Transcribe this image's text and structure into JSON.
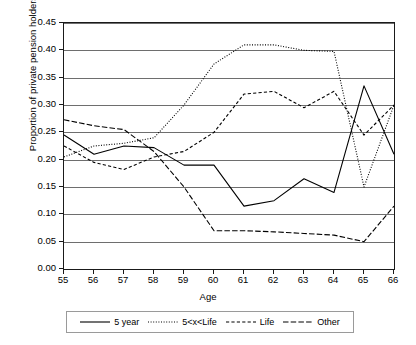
{
  "chart_data": {
    "type": "line",
    "title": "",
    "xlabel": "Age",
    "ylabel": "Proportion of private pension holders",
    "x": [
      55,
      56,
      57,
      58,
      59,
      60,
      61,
      62,
      63,
      64,
      65,
      66
    ],
    "xlim": [
      55,
      66
    ],
    "ylim": [
      0.0,
      0.45
    ],
    "ytick_labels": [
      "0.00",
      "0.05",
      "0.10",
      "0.15",
      "0.20",
      "0.25",
      "0.30",
      "0.35",
      "0.40",
      "0.45"
    ],
    "ytick_values": [
      0.0,
      0.05,
      0.1,
      0.15,
      0.2,
      0.25,
      0.3,
      0.35,
      0.4,
      0.45
    ],
    "xtick_labels": [
      "55",
      "56",
      "57",
      "58",
      "59",
      "60",
      "61",
      "62",
      "63",
      "64",
      "65",
      "66"
    ],
    "grid": true,
    "legend_position": "bottom",
    "series": [
      {
        "name": "5 year",
        "style": "solid",
        "color": "#000000",
        "values": [
          0.245,
          0.21,
          0.225,
          0.222,
          0.19,
          0.19,
          0.115,
          0.125,
          0.165,
          0.14,
          0.335,
          0.21
        ]
      },
      {
        "name": "5<x<Life",
        "style": "dotted",
        "color": "#000000",
        "values": [
          0.205,
          0.225,
          0.23,
          0.24,
          0.3,
          0.375,
          0.41,
          0.41,
          0.4,
          0.398,
          0.15,
          0.3
        ]
      },
      {
        "name": "Life",
        "style": "dashed",
        "color": "#000000",
        "values": [
          0.225,
          0.195,
          0.182,
          0.205,
          0.215,
          0.25,
          0.32,
          0.325,
          0.295,
          0.325,
          0.245,
          0.3
        ]
      },
      {
        "name": "Other",
        "style": "dashdot",
        "color": "#000000",
        "values": [
          0.273,
          0.262,
          0.255,
          0.215,
          0.15,
          0.07,
          0.07,
          0.068,
          0.065,
          0.062,
          0.05,
          0.115
        ]
      }
    ]
  }
}
